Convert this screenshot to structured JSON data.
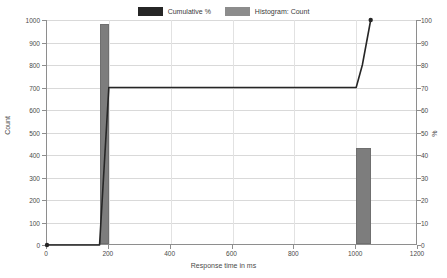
{
  "chart_data": {
    "type": "bar",
    "title": "",
    "xlabel": "Response time in ms",
    "ylabel": "Count",
    "y2label": "%",
    "xlim": [
      0,
      1200
    ],
    "ylim": [
      0,
      1000
    ],
    "y2lim": [
      0,
      100
    ],
    "grid": true,
    "legend_position": "top-center",
    "xticks": [
      0,
      200,
      400,
      600,
      800,
      1000,
      1200
    ],
    "yticks": [
      0,
      100,
      200,
      300,
      400,
      500,
      600,
      700,
      800,
      900,
      1000
    ],
    "y2ticks": [
      0,
      10,
      20,
      30,
      40,
      50,
      60,
      70,
      80,
      90,
      100
    ],
    "series": [
      {
        "name": "Histogram: Count",
        "type": "bar",
        "axis": "left",
        "color": "#7d7d7d",
        "bins": [
          {
            "x_start": 170,
            "x_end": 200,
            "value": 980
          },
          {
            "x_start": 1000,
            "x_end": 1047,
            "value": 425
          }
        ]
      },
      {
        "name": "Cumulative %",
        "type": "line",
        "axis": "right",
        "color": "#262626",
        "points": [
          {
            "x": 0,
            "y": 0
          },
          {
            "x": 170,
            "y": 0
          },
          {
            "x": 200,
            "y": 70
          },
          {
            "x": 1000,
            "y": 70
          },
          {
            "x": 1020,
            "y": 80
          },
          {
            "x": 1047,
            "y": 100
          }
        ],
        "markers": [
          {
            "x": 0,
            "y": 0
          },
          {
            "x": 1047,
            "y": 100
          }
        ]
      }
    ]
  },
  "legend": {
    "entries": [
      {
        "label": "Cumulative %",
        "color": "#262626"
      },
      {
        "label": "Histogram: Count",
        "color": "#8c8c8c"
      }
    ]
  },
  "axes": {
    "x_title": "Response time in ms",
    "y_left_title": "Count",
    "y_right_title": "%"
  }
}
